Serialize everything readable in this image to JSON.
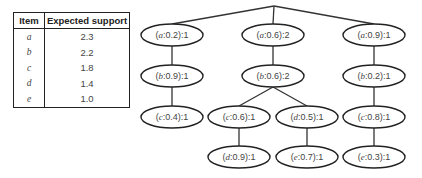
{
  "table": {
    "headers": [
      "Item",
      "Expected support"
    ],
    "rows": [
      {
        "item": "a",
        "support": "2.3"
      },
      {
        "item": "b",
        "support": "2.2"
      },
      {
        "item": "c",
        "support": "1.8"
      },
      {
        "item": "d",
        "support": "1.4"
      },
      {
        "item": "e",
        "support": "1.0"
      }
    ]
  },
  "tree": {
    "root": {
      "x": 274,
      "y": 6
    },
    "nodes": [
      {
        "id": "n1",
        "item": "a",
        "prob": "0.2",
        "count": "1",
        "x": 172,
        "y": 35
      },
      {
        "id": "n2",
        "item": "b",
        "prob": "0.9",
        "count": "1",
        "x": 172,
        "y": 76
      },
      {
        "id": "n3",
        "item": "c",
        "prob": "0.4",
        "count": "1",
        "x": 172,
        "y": 117
      },
      {
        "id": "n4",
        "item": "a",
        "prob": "0.6",
        "count": "2",
        "x": 273,
        "y": 35
      },
      {
        "id": "n5",
        "item": "b",
        "prob": "0.6",
        "count": "2",
        "x": 273,
        "y": 76
      },
      {
        "id": "n6",
        "item": "c",
        "prob": "0.6",
        "count": "1",
        "x": 239,
        "y": 117
      },
      {
        "id": "n7",
        "item": "d",
        "prob": "0.9",
        "count": "1",
        "x": 239,
        "y": 157
      },
      {
        "id": "n8",
        "item": "d",
        "prob": "0.5",
        "count": "1",
        "x": 307,
        "y": 117
      },
      {
        "id": "n9",
        "item": "e",
        "prob": "0.7",
        "count": "1",
        "x": 307,
        "y": 157
      },
      {
        "id": "n10",
        "item": "a",
        "prob": "0.9",
        "count": "1",
        "x": 374,
        "y": 35
      },
      {
        "id": "n11",
        "item": "b",
        "prob": "0.2",
        "count": "1",
        "x": 374,
        "y": 76
      },
      {
        "id": "n12",
        "item": "c",
        "prob": "0.8",
        "count": "1",
        "x": 374,
        "y": 117
      },
      {
        "id": "n13",
        "item": "e",
        "prob": "0.3",
        "count": "1",
        "x": 374,
        "y": 157
      }
    ],
    "edges": [
      [
        "root",
        "n1"
      ],
      [
        "root",
        "n4"
      ],
      [
        "root",
        "n10"
      ],
      [
        "n1",
        "n2"
      ],
      [
        "n2",
        "n3"
      ],
      [
        "n4",
        "n5"
      ],
      [
        "n5",
        "n6"
      ],
      [
        "n5",
        "n8"
      ],
      [
        "n6",
        "n7"
      ],
      [
        "n8",
        "n9"
      ],
      [
        "n10",
        "n11"
      ],
      [
        "n11",
        "n12"
      ],
      [
        "n12",
        "n13"
      ]
    ]
  }
}
